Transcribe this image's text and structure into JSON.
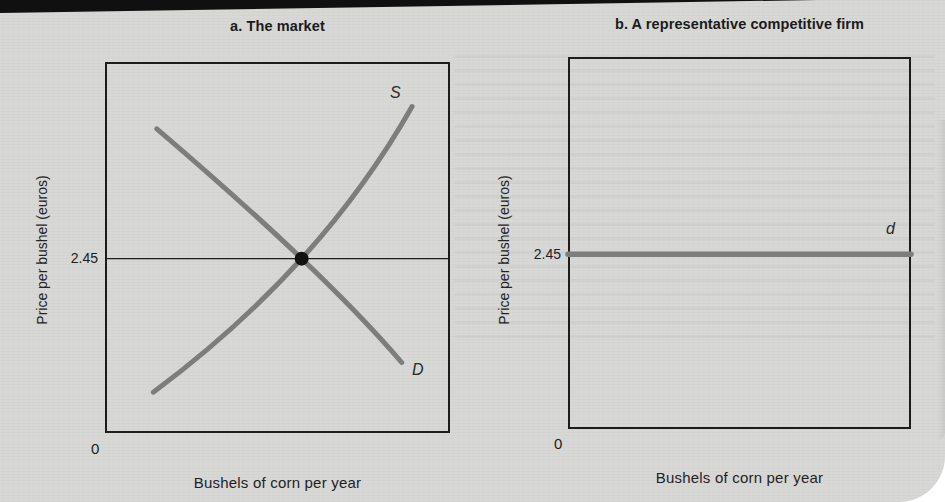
{
  "figure": {
    "panels": [
      {
        "title": "a. The market",
        "ylabel": "Price per bushel (euros)",
        "xlabel": "Bushels of corn per year",
        "origin_label": "0",
        "price_tick": "2.45",
        "labels": {
          "supply": "S",
          "demand": "D"
        }
      },
      {
        "title": "b. A representative competitive firm",
        "ylabel": "Price per bushel (euros)",
        "xlabel": "Bushels of corn per year",
        "origin_label": "0",
        "price_tick": "2.45",
        "labels": {
          "demand": "d"
        }
      }
    ]
  },
  "chart_data": [
    {
      "type": "line",
      "title": "a. The market",
      "xlabel": "Bushels of corn per year",
      "ylabel": "Price per bushel (euros)",
      "yticks": [
        {
          "value": 2.45,
          "label": "2.45"
        }
      ],
      "origin_label": "0",
      "axes_numeric_range_shown": false,
      "series": [
        {
          "name": "D",
          "kind": "demand",
          "description": "Downward-sloping market demand curve",
          "points_norm": [
            [
              0.15,
              0.82
            ],
            [
              0.57,
              0.47
            ],
            [
              0.86,
              0.19
            ]
          ]
        },
        {
          "name": "S",
          "kind": "supply",
          "description": "Upward-sloping market supply curve",
          "points_norm": [
            [
              0.14,
              0.11
            ],
            [
              0.57,
              0.47
            ],
            [
              0.89,
              0.88
            ]
          ]
        }
      ],
      "equilibrium": {
        "price": 2.45,
        "point_norm": [
          0.57,
          0.47
        ]
      },
      "reference_line": {
        "price": 2.45,
        "y_norm": 0.47,
        "style": "thin"
      }
    },
    {
      "type": "line",
      "title": "b. A representative competitive firm",
      "xlabel": "Bushels of corn per year",
      "ylabel": "Price per bushel (euros)",
      "yticks": [
        {
          "value": 2.45,
          "label": "2.45"
        }
      ],
      "origin_label": "0",
      "axes_numeric_range_shown": false,
      "series": [
        {
          "name": "d",
          "kind": "firm-demand",
          "description": "Perfectly elastic demand faced by a single competitive firm at the market price",
          "price": 2.45,
          "points_norm": [
            [
              0.0,
              0.47
            ],
            [
              1.0,
              0.47
            ]
          ]
        }
      ]
    }
  ],
  "colors": {
    "paper": "#d7d7d5",
    "ink": "#1c1c1c",
    "curve_gray": "#7d7d7d",
    "equilibrium_dot": "#111111",
    "top_bar": "#101010"
  }
}
